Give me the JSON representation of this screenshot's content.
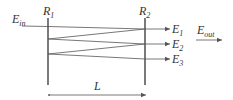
{
  "diagram": {
    "type": "Fabry-Perot etalon (multiple reflection)",
    "colors": {
      "stroke": "#555555",
      "mirror": "#333333",
      "text": "#333333"
    },
    "mirrors": [
      {
        "id": "R1",
        "label": "R",
        "subscript": "1"
      },
      {
        "id": "R2",
        "label": "R",
        "subscript": "2"
      }
    ],
    "input": {
      "label": "E",
      "subscript": "in"
    },
    "outputs": [
      {
        "label": "E",
        "subscript": "1"
      },
      {
        "label": "E",
        "subscript": "2"
      },
      {
        "label": "E",
        "subscript": "3"
      }
    ],
    "total_output": {
      "label": "E",
      "subscript": "out"
    },
    "spacing": {
      "label": "L"
    }
  }
}
